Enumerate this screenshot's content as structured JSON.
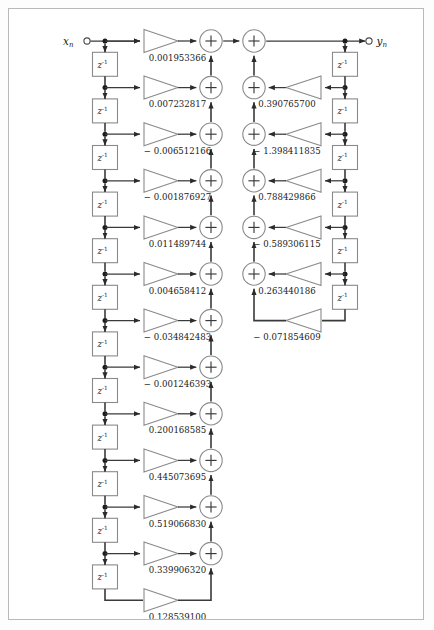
{
  "diagram": {
    "input_label": "x",
    "input_subscript": "n",
    "output_label": "y",
    "output_subscript": "n",
    "delay_label": "z",
    "delay_exponent": "-1",
    "adder_symbol": "+",
    "colors": {
      "wire": "#3a3a3a",
      "shape_stroke": "#8a8a8a",
      "node": "#1b1b1b",
      "frame": "#b9b9b9",
      "background": "#ffffff",
      "text": "#1a1a1a"
    },
    "feedforward": {
      "name": "numerator-coefficients",
      "count": 13,
      "coefficients": [
        "0.001953366",
        "0.007232817",
        "− 0.006512166",
        "− 0.001876927",
        "0.011489744",
        "0.004658412",
        "− 0.034842483",
        "− 0.001246393",
        "0.200168585",
        "0.445073695",
        "0.519066830",
        "0.339906320",
        "0.128539100"
      ]
    },
    "feedback": {
      "name": "denominator-coefficients",
      "count": 6,
      "coefficients": [
        "0.390765700",
        "− 1.398411835",
        "0.788429866",
        "− 0.589306115",
        "0.263440186",
        "− 0.071854609"
      ]
    },
    "delays": {
      "left_count": 12,
      "right_count": 6
    },
    "adders": {
      "left_count": 12,
      "right_count": 6
    }
  }
}
